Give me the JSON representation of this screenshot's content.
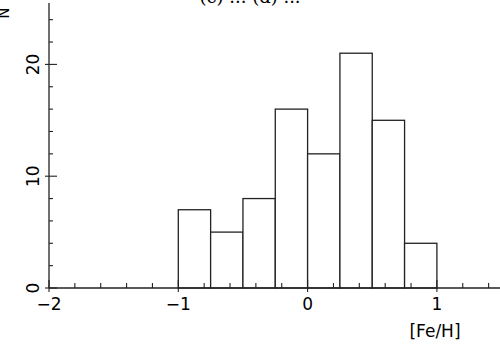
{
  "chart_data": {
    "type": "bar",
    "subtype": "histogram",
    "title": "(c) ... (d) ...",
    "xlabel": "[Fe/H]",
    "ylabel": "N",
    "xlim": [
      -2,
      1.45
    ],
    "ylim": [
      0,
      25.5
    ],
    "bin_width": 0.25,
    "bins": [
      {
        "left": -1.0,
        "right": -0.75,
        "count": 7
      },
      {
        "left": -0.75,
        "right": -0.5,
        "count": 5
      },
      {
        "left": -0.5,
        "right": -0.25,
        "count": 8
      },
      {
        "left": -0.25,
        "right": 0.0,
        "count": 16
      },
      {
        "left": 0.0,
        "right": 0.25,
        "count": 12
      },
      {
        "left": 0.25,
        "right": 0.5,
        "count": 21
      },
      {
        "left": 0.5,
        "right": 0.75,
        "count": 15
      },
      {
        "left": 0.75,
        "right": 1.0,
        "count": 4
      }
    ],
    "categories": [
      "-1.0 to -0.75",
      "-0.75 to -0.5",
      "-0.5 to -0.25",
      "-0.25 to 0",
      "0 to 0.25",
      "0.25 to 0.5",
      "0.5 to 0.75",
      "0.75 to 1.0"
    ],
    "values": [
      7,
      5,
      8,
      16,
      12,
      21,
      15,
      4
    ],
    "x_major_ticks": [
      -2,
      -1,
      0,
      1
    ],
    "x_tick_labels": [
      "−2",
      "−1",
      "0",
      "1"
    ],
    "x_minor_step": 0.2,
    "y_major_ticks": [
      0,
      10,
      20
    ],
    "y_tick_labels": [
      "0",
      "10",
      "20"
    ],
    "y_minor_step": 2,
    "grid": false,
    "legend": null
  },
  "labels": {
    "title_clipped": "(c) ... (d) ...",
    "xlabel": "[Fe/H]",
    "ylabel": "N"
  }
}
